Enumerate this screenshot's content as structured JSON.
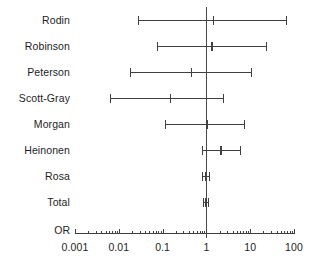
{
  "chart_data": {
    "type": "forest",
    "title": "",
    "xlabel": "OR",
    "ylabel": "",
    "xscale": "log",
    "xlim": [
      0.001,
      100
    ],
    "tick_labels": [
      "0.001",
      "0.01",
      "0.1",
      "1",
      "10",
      "100"
    ],
    "tick_values": [
      0.001,
      0.01,
      0.1,
      1,
      10,
      100
    ],
    "minor_ticks": true,
    "grid": false,
    "legend": "none",
    "null_line": 1,
    "categories": [
      "Rodin",
      "Robinson",
      "Peterson",
      "Scott-Gray",
      "Morgan",
      "Heinonen",
      "Rosa",
      "Total"
    ],
    "rows": [
      {
        "label": "Rodin",
        "estimate": 1.4,
        "ci_low": 0.028,
        "ci_high": 70.0
      },
      {
        "label": "Robinson",
        "estimate": 1.3,
        "ci_low": 0.075,
        "ci_high": 24.0
      },
      {
        "label": "Peterson",
        "estimate": 0.45,
        "ci_low": 0.018,
        "ci_high": 11.0
      },
      {
        "label": "Scott-Gray",
        "estimate": 0.15,
        "ci_low": 0.0062,
        "ci_high": 2.5
      },
      {
        "label": "Morgan",
        "estimate": 1.0,
        "ci_low": 0.115,
        "ci_high": 7.8
      },
      {
        "label": "Heinonen",
        "estimate": 2.1,
        "ci_low": 0.78,
        "ci_high": 6.1
      },
      {
        "label": "Rosa",
        "estimate": 0.92,
        "ci_low": 0.8,
        "ci_high": 1.18
      },
      {
        "label": "Total",
        "estimate": 0.95,
        "ci_low": 0.82,
        "ci_high": 1.15
      }
    ]
  },
  "axis": {
    "title": "OR",
    "ticks": [
      {
        "label": "0.001",
        "value": 0.001
      },
      {
        "label": "0.01",
        "value": 0.01
      },
      {
        "label": "0.1",
        "value": 0.1
      },
      {
        "label": "1",
        "value": 1
      },
      {
        "label": "10",
        "value": 10
      },
      {
        "label": "100",
        "value": 100
      }
    ]
  },
  "colors": {
    "line": "#404040",
    "text": "#1d1d1d",
    "background": "#ffffff",
    "null_line": "#4a4a4a"
  }
}
